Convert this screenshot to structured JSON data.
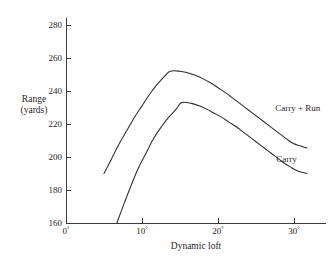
{
  "chart_data": {
    "type": "line",
    "title": "",
    "xlabel": "Dynamic loft",
    "ylabel": "Range (yards)",
    "ylabel_line1": "Range",
    "ylabel_line2": "(yards)",
    "xlim": [
      0,
      31.5
    ],
    "ylim": [
      160,
      285
    ],
    "grid": false,
    "legend_position": "inline-right",
    "x_unit": "degrees",
    "y_unit": "yards",
    "xticks": [
      0,
      10,
      20,
      30
    ],
    "xticklabels": [
      "0°",
      "10°",
      "20°",
      "30°"
    ],
    "yticks": [
      160,
      180,
      200,
      220,
      240,
      260,
      280
    ],
    "yticklabels": [
      "160",
      "180",
      "200",
      "220",
      "240",
      "260",
      "280"
    ],
    "series": [
      {
        "name": "Carry + Run",
        "label": "Carry + Run",
        "color": "#2b2b2b",
        "x": [
          5.0,
          6.0,
          7.0,
          8.0,
          9.0,
          10.0,
          11.0,
          12.0,
          13.0,
          13.7,
          15.0,
          16.0,
          17.0,
          18.0,
          19.0,
          20.0,
          21.0,
          22.0,
          23.0,
          24.0,
          25.0,
          26.0,
          27.0,
          28.0,
          29.0,
          30.0,
          31.7
        ],
        "y": [
          190.0,
          199.0,
          208.0,
          216.0,
          224.0,
          231.0,
          238.0,
          244.0,
          249.0,
          252.0,
          252.0,
          251.0,
          249.5,
          247.5,
          245.0,
          242.0,
          239.0,
          235.5,
          232.0,
          228.5,
          225.0,
          221.5,
          218.0,
          214.5,
          211.0,
          208.0,
          205.5
        ]
      },
      {
        "name": "Carry",
        "label": "Carry",
        "color": "#2b2b2b",
        "x": [
          6.7,
          7.5,
          8.5,
          9.5,
          10.5,
          11.5,
          12.5,
          13.5,
          14.5,
          15.2,
          16.5,
          17.5,
          18.5,
          19.5,
          20.5,
          21.5,
          22.5,
          23.5,
          24.5,
          25.5,
          26.5,
          27.5,
          28.5,
          29.5,
          30.5,
          31.7
        ],
        "y": [
          160.0,
          170.0,
          182.0,
          193.0,
          202.0,
          211.0,
          218.0,
          224.0,
          229.0,
          233.0,
          232.5,
          231.0,
          229.0,
          226.5,
          224.0,
          221.0,
          218.0,
          214.5,
          211.0,
          207.5,
          204.0,
          200.5,
          197.0,
          194.0,
          191.5,
          190.0
        ]
      }
    ],
    "annotations": [
      {
        "text": "Carry + Run",
        "x": 30.5,
        "y": 228
      },
      {
        "text": "Carry",
        "x": 29.0,
        "y": 197
      }
    ]
  }
}
